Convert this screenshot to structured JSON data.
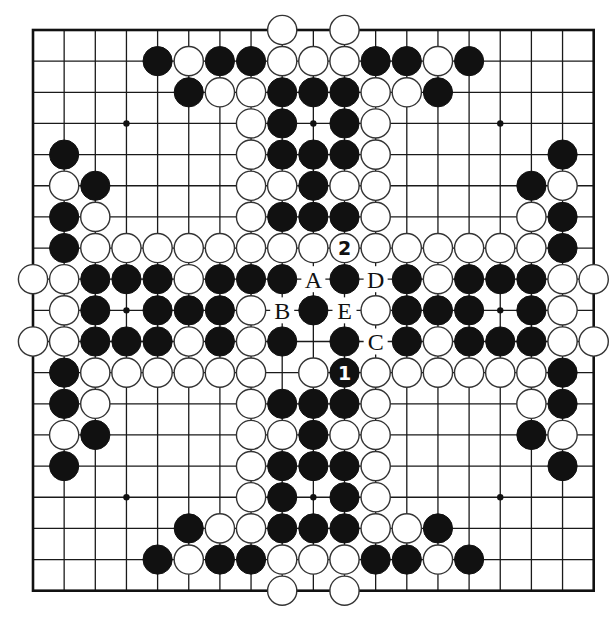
{
  "board": {
    "size": 19,
    "origin_x": 33,
    "origin_y": 30,
    "spacing": 31.15,
    "stone_radius": 14.6,
    "colors": {
      "black": "#111111",
      "white": "#ffffff",
      "line": "#1a1a1a",
      "background": "#ffffff"
    },
    "hoshi": [
      [
        3,
        3
      ],
      [
        3,
        9
      ],
      [
        3,
        15
      ],
      [
        9,
        3
      ],
      [
        9,
        9
      ],
      [
        9,
        15
      ],
      [
        15,
        3
      ],
      [
        15,
        9
      ],
      [
        15,
        15
      ]
    ]
  },
  "stones": {
    "black": [
      [
        1,
        4
      ],
      [
        1,
        6
      ],
      [
        1,
        7
      ],
      [
        1,
        11
      ],
      [
        1,
        12
      ],
      [
        1,
        14
      ],
      [
        2,
        5
      ],
      [
        2,
        8
      ],
      [
        2,
        9
      ],
      [
        2,
        10
      ],
      [
        2,
        13
      ],
      [
        3,
        8
      ],
      [
        3,
        10
      ],
      [
        4,
        1
      ],
      [
        4,
        8
      ],
      [
        4,
        9
      ],
      [
        4,
        10
      ],
      [
        4,
        17
      ],
      [
        5,
        2
      ],
      [
        5,
        9
      ],
      [
        5,
        16
      ],
      [
        6,
        1
      ],
      [
        6,
        8
      ],
      [
        6,
        9
      ],
      [
        6,
        10
      ],
      [
        6,
        17
      ],
      [
        7,
        1
      ],
      [
        7,
        17
      ],
      [
        8,
        2
      ],
      [
        8,
        3
      ],
      [
        8,
        4
      ],
      [
        8,
        6
      ],
      [
        8,
        7
      ],
      [
        8,
        8
      ],
      [
        8,
        10
      ],
      [
        8,
        12
      ],
      [
        8,
        14
      ],
      [
        8,
        15
      ],
      [
        8,
        16
      ],
      [
        9,
        2
      ],
      [
        9,
        4
      ],
      [
        9,
        5
      ],
      [
        9,
        6
      ],
      [
        9,
        9
      ],
      [
        9,
        12
      ],
      [
        9,
        13
      ],
      [
        9,
        14
      ],
      [
        9,
        16
      ],
      [
        10,
        2
      ],
      [
        10,
        3
      ],
      [
        10,
        4
      ],
      [
        10,
        6
      ],
      [
        10,
        8
      ],
      [
        10,
        10
      ],
      [
        10,
        12
      ],
      [
        10,
        14
      ],
      [
        10,
        15
      ],
      [
        10,
        16
      ],
      [
        11,
        1
      ],
      [
        11,
        17
      ],
      [
        12,
        1
      ],
      [
        12,
        8
      ],
      [
        12,
        9
      ],
      [
        12,
        10
      ],
      [
        12,
        17
      ],
      [
        13,
        2
      ],
      [
        13,
        9
      ],
      [
        13,
        16
      ],
      [
        14,
        1
      ],
      [
        14,
        8
      ],
      [
        14,
        9
      ],
      [
        14,
        10
      ],
      [
        14,
        17
      ],
      [
        15,
        8
      ],
      [
        15,
        10
      ],
      [
        16,
        5
      ],
      [
        16,
        8
      ],
      [
        16,
        9
      ],
      [
        16,
        10
      ],
      [
        16,
        13
      ],
      [
        17,
        4
      ],
      [
        17,
        6
      ],
      [
        17,
        7
      ],
      [
        17,
        11
      ],
      [
        17,
        12
      ],
      [
        17,
        14
      ]
    ],
    "white": [
      [
        0,
        8
      ],
      [
        0,
        10
      ],
      [
        1,
        5
      ],
      [
        1,
        8
      ],
      [
        1,
        9
      ],
      [
        1,
        10
      ],
      [
        1,
        13
      ],
      [
        2,
        6
      ],
      [
        2,
        7
      ],
      [
        2,
        11
      ],
      [
        2,
        12
      ],
      [
        3,
        7
      ],
      [
        3,
        11
      ],
      [
        4,
        7
      ],
      [
        4,
        11
      ],
      [
        5,
        1
      ],
      [
        5,
        7
      ],
      [
        5,
        8
      ],
      [
        5,
        10
      ],
      [
        5,
        11
      ],
      [
        5,
        17
      ],
      [
        6,
        2
      ],
      [
        6,
        7
      ],
      [
        6,
        11
      ],
      [
        6,
        16
      ],
      [
        7,
        2
      ],
      [
        7,
        3
      ],
      [
        7,
        4
      ],
      [
        7,
        5
      ],
      [
        7,
        6
      ],
      [
        7,
        7
      ],
      [
        7,
        8
      ],
      [
        7,
        9
      ],
      [
        7,
        11
      ],
      [
        7,
        12
      ],
      [
        7,
        13
      ],
      [
        7,
        14
      ],
      [
        7,
        15
      ],
      [
        7,
        16
      ],
      [
        8,
        0
      ],
      [
        8,
        1
      ],
      [
        8,
        5
      ],
      [
        8,
        13
      ],
      [
        8,
        17
      ],
      [
        8,
        18
      ],
      [
        9,
        1
      ],
      [
        9,
        7
      ],
      [
        9,
        11
      ],
      [
        9,
        17
      ],
      [
        10,
        0
      ],
      [
        10,
        1
      ],
      [
        10,
        5
      ],
      [
        10,
        7
      ],
      [
        10,
        13
      ],
      [
        10,
        17
      ],
      [
        10,
        18
      ],
      [
        11,
        2
      ],
      [
        11,
        3
      ],
      [
        11,
        4
      ],
      [
        11,
        5
      ],
      [
        11,
        6
      ],
      [
        11,
        7
      ],
      [
        11,
        9
      ],
      [
        11,
        11
      ],
      [
        11,
        12
      ],
      [
        11,
        13
      ],
      [
        11,
        14
      ],
      [
        11,
        15
      ],
      [
        11,
        16
      ],
      [
        12,
        2
      ],
      [
        12,
        7
      ],
      [
        12,
        11
      ],
      [
        12,
        16
      ],
      [
        13,
        1
      ],
      [
        13,
        7
      ],
      [
        13,
        8
      ],
      [
        13,
        10
      ],
      [
        13,
        11
      ],
      [
        13,
        17
      ],
      [
        14,
        7
      ],
      [
        14,
        11
      ],
      [
        15,
        7
      ],
      [
        15,
        11
      ],
      [
        16,
        6
      ],
      [
        16,
        7
      ],
      [
        16,
        11
      ],
      [
        16,
        12
      ],
      [
        17,
        5
      ],
      [
        17,
        8
      ],
      [
        17,
        9
      ],
      [
        17,
        10
      ],
      [
        17,
        13
      ],
      [
        18,
        8
      ],
      [
        18,
        10
      ]
    ]
  },
  "numbered_moves": [
    {
      "number": "1",
      "color": "black",
      "row": 11,
      "col": 10
    },
    {
      "number": "2",
      "color": "white",
      "row": 7,
      "col": 10
    }
  ],
  "point_labels": [
    {
      "text": "A",
      "row": 8,
      "col": 9
    },
    {
      "text": "B",
      "row": 9,
      "col": 8
    },
    {
      "text": "C",
      "row": 10,
      "col": 11
    },
    {
      "text": "D",
      "row": 8,
      "col": 11
    },
    {
      "text": "E",
      "row": 9,
      "col": 10
    }
  ]
}
